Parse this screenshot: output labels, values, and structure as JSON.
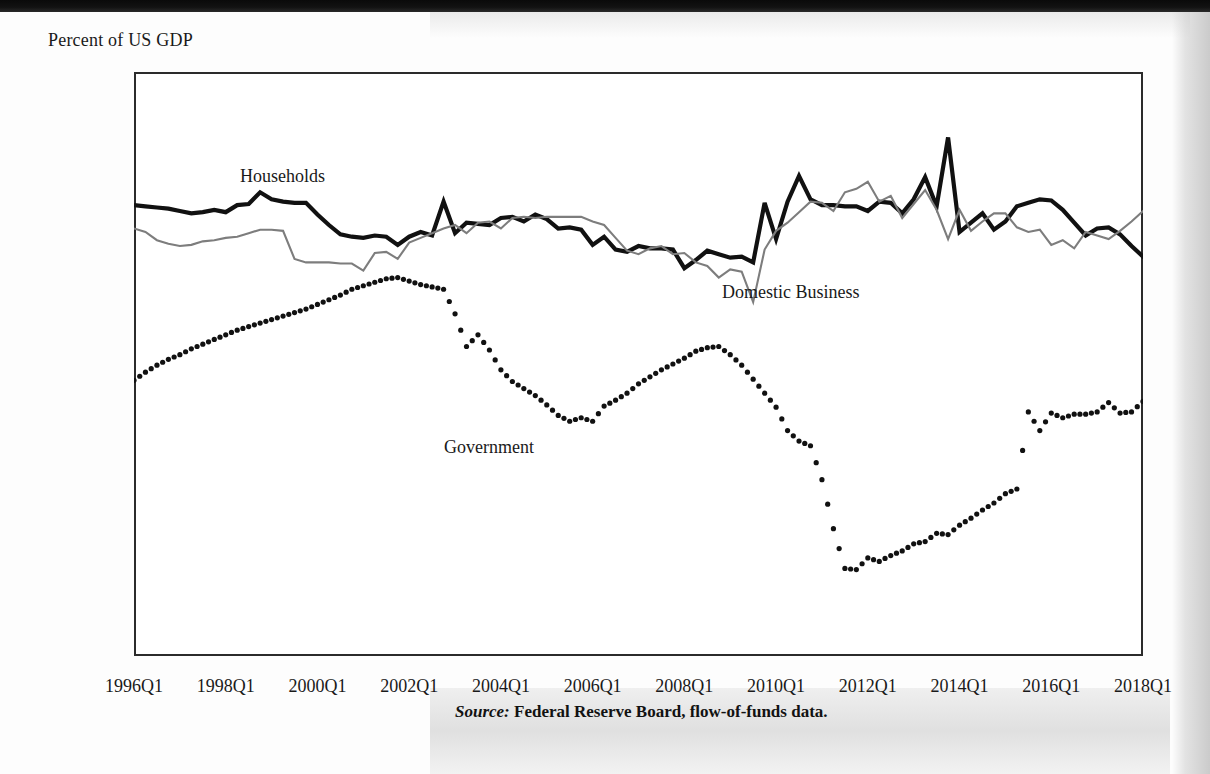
{
  "figure": {
    "axis_caption": "Percent of US GDP",
    "source_keyword": "Source:",
    "source_text": " Federal Reserve Board, flow-of-funds data."
  },
  "annotations": {
    "households": "Households",
    "domestic_business": "Domestic Business",
    "government": "Government"
  },
  "chart_data": {
    "type": "line",
    "title": "",
    "subtitle": "",
    "xlabel": "",
    "ylabel": "Percent of US GDP",
    "ylim": [
      -15,
      10
    ],
    "xlim": [
      "1996Q1",
      "2018Q1"
    ],
    "grid": false,
    "legend_position": "inline-annotations",
    "ytick_labels": [
      "10.00%",
      "5.00%",
      "0.00%",
      "-5.00%",
      "-10.00%",
      "-15.00%"
    ],
    "ytick_values": [
      10,
      5,
      0,
      -5,
      -10,
      -15
    ],
    "xtick_labels": [
      "1996Q1",
      "1998Q1",
      "2000Q1",
      "2002Q1",
      "2004Q1",
      "2006Q1",
      "2008Q1",
      "2010Q1",
      "2012Q1",
      "2014Q1",
      "2016Q1",
      "2018Q1"
    ],
    "xtick_values": [
      0,
      8,
      16,
      24,
      32,
      40,
      48,
      56,
      64,
      72,
      80,
      88
    ],
    "n_points": 89,
    "series": [
      {
        "name": "Households",
        "style": "solid-thick",
        "color": "#111111",
        "values": [
          4.3,
          4.25,
          4.2,
          4.15,
          4.05,
          3.95,
          4.0,
          4.1,
          4.0,
          4.3,
          4.35,
          4.85,
          4.55,
          4.45,
          4.4,
          4.4,
          3.9,
          3.45,
          3.05,
          2.95,
          2.9,
          3.0,
          2.95,
          2.6,
          2.95,
          3.15,
          3.0,
          4.45,
          3.1,
          3.55,
          3.5,
          3.45,
          3.75,
          3.8,
          3.6,
          3.9,
          3.7,
          3.3,
          3.35,
          3.25,
          2.6,
          2.95,
          2.4,
          2.3,
          2.55,
          2.45,
          2.45,
          2.4,
          1.6,
          1.95,
          2.35,
          2.2,
          2.05,
          2.1,
          1.85,
          4.4,
          2.85,
          4.45,
          5.55,
          4.55,
          4.3,
          4.3,
          4.25,
          4.25,
          4.05,
          4.45,
          4.4,
          3.95,
          4.55,
          5.5,
          4.25,
          7.2,
          3.15,
          3.55,
          3.95,
          3.25,
          3.6,
          4.25,
          4.4,
          4.55,
          4.5,
          4.1,
          3.55,
          3.0,
          3.3,
          3.35,
          3.05,
          2.55,
          2.1,
          2.4
        ]
      },
      {
        "name": "Domestic Business",
        "style": "solid-thin",
        "color": "#7d7d7d",
        "values": [
          3.3,
          3.15,
          2.8,
          2.65,
          2.55,
          2.6,
          2.75,
          2.8,
          2.9,
          2.95,
          3.1,
          3.25,
          3.25,
          3.2,
          2.0,
          1.85,
          1.85,
          1.85,
          1.8,
          1.8,
          1.5,
          2.25,
          2.3,
          2.0,
          2.7,
          2.9,
          3.1,
          3.3,
          3.45,
          3.1,
          3.55,
          3.6,
          3.3,
          3.75,
          3.8,
          3.75,
          3.8,
          3.8,
          3.8,
          3.8,
          3.6,
          3.45,
          2.9,
          2.35,
          2.2,
          2.45,
          2.55,
          2.2,
          2.25,
          1.85,
          1.7,
          1.2,
          1.55,
          1.45,
          0.15,
          2.4,
          3.2,
          3.55,
          4.0,
          4.45,
          4.4,
          4.05,
          4.85,
          5.0,
          5.3,
          4.45,
          4.7,
          3.75,
          4.35,
          4.95,
          4.1,
          2.85,
          4.1,
          3.2,
          3.6,
          3.95,
          3.95,
          3.35,
          3.15,
          3.25,
          2.6,
          2.8,
          2.45,
          3.15,
          3.0,
          2.85,
          3.2,
          3.6,
          4.05,
          4.35
        ]
      },
      {
        "name": "Government",
        "style": "dotted",
        "color": "#111111",
        "values": [
          -3.2,
          -2.85,
          -2.55,
          -2.3,
          -2.1,
          -1.85,
          -1.65,
          -1.45,
          -1.25,
          -1.05,
          -0.9,
          -0.75,
          -0.6,
          -0.45,
          -0.3,
          -0.15,
          0.05,
          0.25,
          0.45,
          0.7,
          0.85,
          1.0,
          1.15,
          1.2,
          1.05,
          0.9,
          0.8,
          0.7,
          -0.35,
          -1.75,
          -1.25,
          -1.9,
          -2.75,
          -3.25,
          -3.55,
          -3.85,
          -4.25,
          -4.7,
          -4.95,
          -4.8,
          -4.95,
          -4.3,
          -4.05,
          -3.75,
          -3.35,
          -3.05,
          -2.75,
          -2.5,
          -2.25,
          -1.95,
          -1.8,
          -1.75,
          -2.1,
          -2.55,
          -3.15,
          -3.75,
          -4.35,
          -5.35,
          -5.8,
          -6.0,
          -7.45,
          -9.55,
          -11.25,
          -11.3,
          -10.8,
          -10.95,
          -10.7,
          -10.5,
          -10.2,
          -10.1,
          -9.75,
          -9.8,
          -9.4,
          -9.1,
          -8.75,
          -8.45,
          -8.05,
          -7.85,
          -4.55,
          -5.35,
          -4.6,
          -4.8,
          -4.65,
          -4.65,
          -4.55,
          -4.15,
          -4.6,
          -4.55,
          -4.1,
          -5.35
        ]
      }
    ]
  }
}
